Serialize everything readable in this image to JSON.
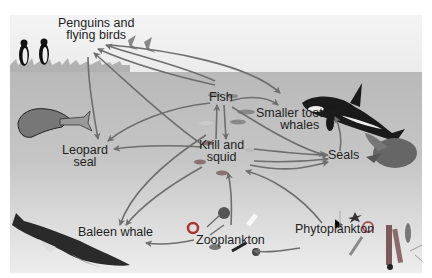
{
  "diagram": {
    "type": "food-web",
    "color_scheme": "grayscale",
    "colors": {
      "sky": "#f0f0f0",
      "sea_top": "#b9b9b9",
      "sea_bottom": "#ededed",
      "arrow": "#6e6e6e",
      "label": "#1e1e1e"
    },
    "nodes": {
      "penguins": {
        "line1": "Penguins and",
        "line2": "flying birds"
      },
      "fish": {
        "line1": "Fish"
      },
      "toothed_whales": {
        "line1": "Smaller toothed",
        "line2": "whales"
      },
      "leopard_seal": {
        "line1": "Leopard",
        "line2": "seal"
      },
      "krill": {
        "line1": "Krill and",
        "line2": "squid"
      },
      "seals": {
        "line1": "Seals"
      },
      "baleen_whale": {
        "line1": "Baleen whale"
      },
      "zooplankton": {
        "line1": "Zooplankton"
      },
      "phytoplankton": {
        "line1": "Phytoplankton"
      }
    },
    "edges": [
      {
        "from": "Fish",
        "to": "Penguins and flying birds"
      },
      {
        "from": "Krill and squid",
        "to": "Penguins and flying birds"
      },
      {
        "from": "Fish",
        "to": "Penguins and flying birds (2)"
      },
      {
        "from": "Penguins and flying birds",
        "to": "Leopard seal"
      },
      {
        "from": "Penguins and flying birds",
        "to": "Smaller toothed whales"
      },
      {
        "from": "Fish",
        "to": "Smaller toothed whales"
      },
      {
        "from": "Fish",
        "to": "Leopard seal"
      },
      {
        "from": "Fish",
        "to": "Seals"
      },
      {
        "from": "Fish",
        "to": "Krill and squid"
      },
      {
        "from": "Krill and squid",
        "to": "Fish"
      },
      {
        "from": "Krill and squid",
        "to": "Leopard seal"
      },
      {
        "from": "Krill and squid",
        "to": "Seals"
      },
      {
        "from": "Krill and squid",
        "to": "Baleen whale"
      },
      {
        "from": "Seals",
        "to": "Smaller toothed whales"
      },
      {
        "from": "Zooplankton",
        "to": "Krill and squid"
      },
      {
        "from": "Zooplankton",
        "to": "Baleen whale"
      },
      {
        "from": "Phytoplankton",
        "to": "Zooplankton"
      },
      {
        "from": "Phytoplankton",
        "to": "Krill and squid"
      }
    ]
  }
}
